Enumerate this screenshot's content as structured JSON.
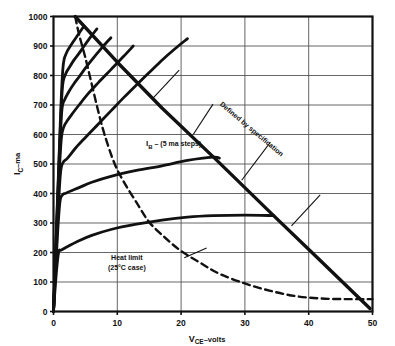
{
  "figure": {
    "background_color": "#ffffff",
    "ink_color": "#111111",
    "grid_color": "#555555"
  },
  "chart_data": {
    "type": "line",
    "title": "",
    "subtitle": "",
    "xlabel": "V_CE-volts",
    "xlabel_main": "V",
    "xlabel_sub": "CE",
    "xlabel_tail": "–volts",
    "ylabel": "I_C -ma",
    "ylabel_main": "I",
    "ylabel_sub": "C",
    "ylabel_tail": "–ma",
    "xlim": [
      0,
      50
    ],
    "ylim": [
      0,
      1000
    ],
    "xticks": [
      0,
      10,
      20,
      30,
      40,
      50
    ],
    "xtick_labels": [
      "0",
      "10",
      "20",
      "30",
      "40",
      "50"
    ],
    "yticks": [
      0,
      100,
      200,
      300,
      400,
      500,
      600,
      700,
      800,
      900,
      1000
    ],
    "ytick_labels": [
      "0",
      "100",
      "200",
      "300",
      "400",
      "500",
      "600",
      "700",
      "800",
      "900",
      "1000"
    ],
    "grid": true,
    "grid_x": [
      10,
      20,
      30,
      40
    ],
    "grid_y": [
      100,
      200,
      300,
      400,
      500,
      600,
      700,
      800,
      900
    ],
    "legend": false,
    "legend_position": "none",
    "series": [
      {
        "name": "I_B curve 1 (lowest step)",
        "style": "solid-bold",
        "points": [
          [
            0,
            0
          ],
          [
            0.4,
            120
          ],
          [
            0.8,
            200
          ],
          [
            1.2,
            208
          ],
          [
            2,
            218
          ],
          [
            4,
            240
          ],
          [
            6,
            258
          ],
          [
            9,
            278
          ],
          [
            13,
            296
          ],
          [
            17,
            310
          ],
          [
            21,
            320
          ],
          [
            25,
            325
          ],
          [
            30,
            327
          ],
          [
            34.5,
            325
          ]
        ]
      },
      {
        "name": "I_B curve 2",
        "style": "solid-bold",
        "points": [
          [
            0,
            0
          ],
          [
            0.6,
            250
          ],
          [
            1.0,
            370
          ],
          [
            1.4,
            395
          ],
          [
            2,
            402
          ],
          [
            4,
            420
          ],
          [
            6,
            438
          ],
          [
            9,
            458
          ],
          [
            13,
            478
          ],
          [
            17,
            494
          ],
          [
            21,
            512
          ],
          [
            25,
            523
          ],
          [
            26,
            520
          ]
        ]
      },
      {
        "name": "I_B curve 3",
        "style": "solid-bold",
        "points": [
          [
            0,
            0
          ],
          [
            0.7,
            330
          ],
          [
            1.1,
            470
          ],
          [
            1.5,
            505
          ],
          [
            2.2,
            520
          ],
          [
            3.5,
            555
          ],
          [
            5,
            590
          ],
          [
            7,
            635
          ],
          [
            9,
            680
          ],
          [
            11,
            725
          ],
          [
            13,
            768
          ],
          [
            15,
            810
          ],
          [
            17,
            852
          ],
          [
            19,
            890
          ],
          [
            21,
            925
          ]
        ]
      },
      {
        "name": "I_B curve 4",
        "style": "solid-bold",
        "points": [
          [
            0,
            0
          ],
          [
            0.8,
            420
          ],
          [
            1.2,
            580
          ],
          [
            1.6,
            625
          ],
          [
            2.2,
            648
          ],
          [
            3,
            672
          ],
          [
            4,
            700
          ],
          [
            5.5,
            740
          ],
          [
            7,
            775
          ],
          [
            9,
            820
          ],
          [
            11,
            865
          ],
          [
            12.5,
            900
          ]
        ]
      },
      {
        "name": "I_B curve 5",
        "style": "solid-bold",
        "points": [
          [
            0,
            0
          ],
          [
            0.9,
            500
          ],
          [
            1.3,
            680
          ],
          [
            1.8,
            720
          ],
          [
            2.4,
            745
          ],
          [
            3.2,
            772
          ],
          [
            4,
            795
          ],
          [
            5,
            825
          ],
          [
            6.2,
            858
          ],
          [
            7.5,
            892
          ],
          [
            9,
            928
          ]
        ]
      },
      {
        "name": "I_B curve 6",
        "style": "solid-bold",
        "points": [
          [
            0,
            0
          ],
          [
            1.0,
            580
          ],
          [
            1.4,
            760
          ],
          [
            1.9,
            805
          ],
          [
            2.5,
            828
          ],
          [
            3.2,
            852
          ],
          [
            4,
            875
          ],
          [
            4.8,
            900
          ],
          [
            5.8,
            930
          ],
          [
            6.8,
            958
          ]
        ]
      },
      {
        "name": "I_B curve 7 (highest step)",
        "style": "solid-bold",
        "points": [
          [
            0,
            0
          ],
          [
            1.1,
            660
          ],
          [
            1.5,
            830
          ],
          [
            2.0,
            875
          ],
          [
            2.6,
            898
          ],
          [
            3.2,
            918
          ],
          [
            3.9,
            940
          ],
          [
            4.6,
            962
          ]
        ]
      },
      {
        "name": "Defined by specification limit line",
        "style": "solid-heavy",
        "points": [
          [
            3.4,
            1000
          ],
          [
            10,
            845
          ],
          [
            17,
            690
          ],
          [
            25,
            525
          ],
          [
            34.5,
            325
          ],
          [
            41,
            190
          ],
          [
            49.6,
            10
          ]
        ]
      },
      {
        "name": "Heat limit (25°C case)",
        "style": "dashed",
        "points": [
          [
            3.4,
            1000
          ],
          [
            4,
            940
          ],
          [
            5,
            860
          ],
          [
            6,
            770
          ],
          [
            7,
            680
          ],
          [
            8,
            600
          ],
          [
            9.5,
            505
          ],
          [
            11,
            440
          ],
          [
            13,
            370
          ],
          [
            15,
            303
          ],
          [
            17.5,
            250
          ],
          [
            20,
            205
          ],
          [
            23,
            165
          ],
          [
            26,
            128
          ],
          [
            30,
            95
          ],
          [
            34,
            70
          ],
          [
            38,
            52
          ],
          [
            42,
            44
          ],
          [
            46,
            42
          ],
          [
            50,
            42
          ]
        ]
      }
    ],
    "annotations": [
      {
        "id": "ib-label",
        "text": "I",
        "sub": "B",
        "tail": " – (5 ma steps)",
        "x": 14.5,
        "y": 560
      },
      {
        "id": "defined-by-spec",
        "text": "Defined by specification",
        "x": 26,
        "y": 700,
        "rotation": 40
      },
      {
        "id": "heat-limit",
        "line1": "Heat limit",
        "line2": "(25°C case)",
        "x": 11.5,
        "y": 175
      }
    ],
    "leader_lines": [
      {
        "id": "leader-spec-1",
        "from": [
          19.7,
          818
        ],
        "to": [
          15.6,
          723
        ]
      },
      {
        "id": "leader-spec-2",
        "from": [
          25.0,
          703
        ],
        "to": [
          21.9,
          600
        ]
      },
      {
        "id": "leader-spec-3",
        "from": [
          34.0,
          574
        ],
        "to": [
          29.5,
          445
        ]
      },
      {
        "id": "leader-spec-4",
        "from": [
          41.8,
          395
        ],
        "to": [
          37.3,
          290
        ]
      },
      {
        "id": "leader-heat",
        "from": [
          20.5,
          182
        ],
        "to": [
          24.0,
          215
        ]
      }
    ]
  }
}
